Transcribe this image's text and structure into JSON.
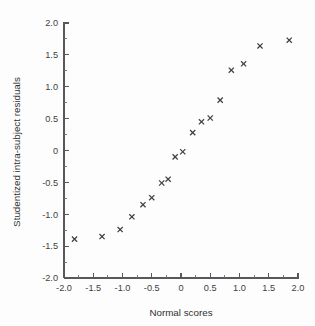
{
  "chart_data": {
    "type": "scatter",
    "title": "",
    "xlabel": "Normal scores",
    "ylabel": "Studentized intra-subject residuals",
    "xlim": [
      -2.0,
      2.0
    ],
    "ylim": [
      -2.0,
      2.0
    ],
    "grid": false,
    "legend": null,
    "marker": "x",
    "marker_color": "#404042",
    "xticks": [
      -2.0,
      -1.5,
      -1.0,
      -0.5,
      0,
      0.5,
      1.0,
      1.5,
      2.0
    ],
    "xtick_labels": [
      "-2.0",
      "-1.5",
      "-1.0",
      "-0.5",
      "0",
      "0.5",
      "1.0",
      "1.5",
      "2.0"
    ],
    "yticks": [
      -2.0,
      -1.5,
      -1.0,
      -0.5,
      0,
      0.5,
      1.0,
      1.5,
      2.0
    ],
    "ytick_labels": [
      "-2.0",
      "-1.5",
      "-1.0",
      "-0.5",
      "0",
      "0.5",
      "1.0",
      "1.5",
      "2.0"
    ],
    "x": [
      -1.82,
      -1.35,
      -1.04,
      -0.84,
      -0.65,
      -0.5,
      -0.33,
      -0.22,
      -0.1,
      0.03,
      0.2,
      0.35,
      0.5,
      0.67,
      0.86,
      1.07,
      1.35,
      1.85
    ],
    "y": [
      -1.39,
      -1.35,
      -1.24,
      -1.04,
      -0.85,
      -0.74,
      -0.51,
      -0.45,
      -0.1,
      -0.02,
      0.28,
      0.45,
      0.51,
      0.79,
      1.26,
      1.36,
      1.64,
      1.73
    ],
    "n_points": 18
  },
  "axes": {
    "x_title": "Normal scores",
    "y_title": "Studentized intra-subject residuals"
  },
  "colors": {
    "axis": "#58585a",
    "text": "#3f3f41",
    "marker": "#404042",
    "background": "#fdfdfd"
  }
}
